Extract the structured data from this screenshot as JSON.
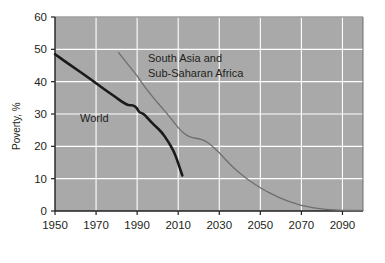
{
  "chart_data": {
    "type": "line",
    "title": "",
    "xlabel": "",
    "ylabel": "Poverty, %",
    "xlim": [
      1950,
      2100
    ],
    "ylim": [
      0,
      60
    ],
    "grid": true,
    "legend_position": "inline-annotation",
    "xticks": [
      "1950",
      "1970",
      "1990",
      "2010",
      "2030",
      "2050",
      "2070",
      "2090"
    ],
    "xtick_values": [
      1950,
      1970,
      1990,
      2010,
      2030,
      2050,
      2070,
      2090
    ],
    "yticks": [
      "0",
      "10",
      "20",
      "30",
      "40",
      "50",
      "60"
    ],
    "ytick_values": [
      0,
      10,
      20,
      30,
      40,
      50,
      60
    ],
    "plot_bgcolor": "#a9a9a9",
    "grid_color": "#ffffff",
    "axis_color": "#231f20",
    "series": [
      {
        "name": "World",
        "label": "World",
        "color": "#1a1a1a",
        "width": 2.6,
        "label_x": 1978,
        "label_y": 33.5,
        "x": [
          1950,
          1955,
          1960,
          1965,
          1970,
          1975,
          1980,
          1983,
          1986,
          1988,
          1990,
          1991,
          1993,
          1995,
          1997,
          1999,
          2002,
          2005,
          2008,
          2010,
          2012
        ],
        "y": [
          48.5,
          46.2,
          44.0,
          41.8,
          39.5,
          37.2,
          35.0,
          33.6,
          32.6,
          32.8,
          31.8,
          30.4,
          30.2,
          28.8,
          27.4,
          26.2,
          24.4,
          21.6,
          18.4,
          14.8,
          11.0
        ]
      },
      {
        "name": "South Asia and Sub-Saharan Africa",
        "label": "South Asia and\nSub-Saharan Africa",
        "color": "#6e6e6e",
        "width": 1.3,
        "label_x": 2001,
        "label_y": 52.5,
        "x": [
          1981,
          1984,
          1987,
          1990,
          1993,
          1996,
          1999,
          2002,
          2005,
          2008,
          2011,
          2014,
          2017,
          2020,
          2023,
          2026,
          2029,
          2030,
          2032,
          2035,
          2038,
          2041,
          2044,
          2047,
          2050,
          2053,
          2056,
          2059,
          2062,
          2065,
          2068,
          2071,
          2074,
          2078,
          2082,
          2086,
          2090,
          2095,
          2100
        ],
        "y": [
          49.0,
          46.5,
          44.2,
          41.8,
          39.0,
          36.6,
          34.2,
          32.0,
          29.8,
          27.4,
          25.0,
          23.4,
          22.6,
          22.4,
          21.8,
          20.4,
          18.6,
          18.0,
          16.6,
          14.6,
          12.8,
          11.2,
          9.7,
          8.4,
          7.2,
          6.1,
          5.1,
          4.2,
          3.4,
          2.7,
          2.1,
          1.6,
          1.2,
          0.8,
          0.5,
          0.35,
          0.25,
          0.18,
          0.14
        ]
      }
    ]
  },
  "annotations": {
    "world_label": "World",
    "asia_africa_label_line1": "South Asia and",
    "asia_africa_label_line2": "Sub-Saharan Africa"
  }
}
